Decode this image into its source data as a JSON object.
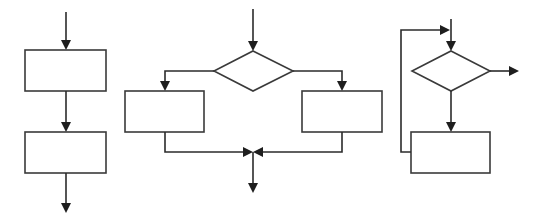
{
  "diagram": {
    "title": "",
    "colors": {
      "line": "#2b2b2b",
      "shape_border": "#3a3a3a",
      "fill": "#ffffff",
      "background": "#ffffff"
    },
    "structures": [
      {
        "id": "sequence",
        "nodes": [
          {
            "id": "seq-box-1",
            "type": "process",
            "label": "",
            "x": 25,
            "y": 50,
            "w": 81,
            "h": 41
          },
          {
            "id": "seq-box-2",
            "type": "process",
            "label": "",
            "x": 25,
            "y": 132,
            "w": 81,
            "h": 41
          }
        ],
        "edges": [
          {
            "from": "entry",
            "to": "seq-box-1"
          },
          {
            "from": "seq-box-1",
            "to": "seq-box-2"
          },
          {
            "from": "seq-box-2",
            "to": "exit"
          }
        ]
      },
      {
        "id": "selection",
        "nodes": [
          {
            "id": "sel-decision",
            "type": "decision",
            "label": "",
            "cx": 253,
            "cy": 71,
            "w": 79,
            "h": 40
          },
          {
            "id": "sel-box-left",
            "type": "process",
            "label": "",
            "x": 125,
            "y": 91,
            "w": 79,
            "h": 41
          },
          {
            "id": "sel-box-right",
            "type": "process",
            "label": "",
            "x": 302,
            "y": 91,
            "w": 80,
            "h": 41
          }
        ],
        "edges": [
          {
            "from": "entry",
            "to": "sel-decision"
          },
          {
            "from": "sel-decision",
            "to": "sel-box-left"
          },
          {
            "from": "sel-decision",
            "to": "sel-box-right"
          },
          {
            "from": "sel-box-left",
            "to": "merge"
          },
          {
            "from": "sel-box-right",
            "to": "merge"
          },
          {
            "from": "merge",
            "to": "exit"
          }
        ]
      },
      {
        "id": "loop",
        "nodes": [
          {
            "id": "loop-decision",
            "type": "decision",
            "label": "",
            "cx": 451,
            "cy": 71,
            "w": 78,
            "h": 40
          },
          {
            "id": "loop-box",
            "type": "process",
            "label": "",
            "x": 411,
            "y": 132,
            "w": 79,
            "h": 41
          }
        ],
        "edges": [
          {
            "from": "entry",
            "to": "loop-decision"
          },
          {
            "from": "loop-decision",
            "to": "loop-box"
          },
          {
            "from": "loop-box",
            "to": "loop-decision",
            "kind": "loop-back"
          },
          {
            "from": "loop-decision",
            "to": "exit"
          }
        ]
      }
    ]
  }
}
